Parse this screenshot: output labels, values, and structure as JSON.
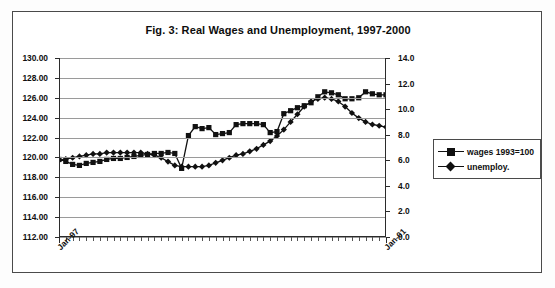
{
  "chart_data": {
    "type": "line",
    "title": "Fig. 3: Real Wages and Unemployment, 1997-2000",
    "xlabel": "",
    "ylabel": "",
    "grid": true,
    "legend_position": "right",
    "x_tick_labels": [
      "Jan-97",
      "Jan-01"
    ],
    "x_tick_label_positions": [
      0,
      48
    ],
    "x_count": 49,
    "y_left": {
      "min": 112.0,
      "max": 130.0,
      "step": 2.0,
      "ticks": [
        "112.00",
        "114.00",
        "116.00",
        "118.00",
        "120.00",
        "122.00",
        "124.00",
        "126.00",
        "128.00",
        "130.00"
      ]
    },
    "y_right": {
      "min": 0.0,
      "max": 14.0,
      "step": 2.0,
      "ticks": [
        "0.0",
        "2.0",
        "4.0",
        "6.0",
        "8.0",
        "10.0",
        "12.0",
        "14.0"
      ]
    },
    "series": [
      {
        "name": "wages 1993=100",
        "marker": "square",
        "axis": "left",
        "color": "#111111",
        "values": [
          119.8,
          119.6,
          119.3,
          119.2,
          119.4,
          119.5,
          119.6,
          119.8,
          119.9,
          119.9,
          120.0,
          120.1,
          120.2,
          120.3,
          120.4,
          120.4,
          120.5,
          120.4,
          118.9,
          122.2,
          123.1,
          122.9,
          123.0,
          122.3,
          122.4,
          122.5,
          123.3,
          123.4,
          123.4,
          123.4,
          123.3,
          122.5,
          122.6,
          124.4,
          124.7,
          125.0,
          125.2,
          125.5,
          126.1,
          126.6,
          126.5,
          126.3,
          125.9,
          125.9,
          126.0,
          126.6,
          126.4,
          126.3,
          126.3
        ]
      },
      {
        "name": "unemploy.",
        "marker": "diamond",
        "axis": "right",
        "color": "#111111",
        "values": [
          6.0,
          6.1,
          6.2,
          6.3,
          6.4,
          6.5,
          6.5,
          6.6,
          6.6,
          6.6,
          6.6,
          6.6,
          6.6,
          6.5,
          6.4,
          6.2,
          5.9,
          5.6,
          5.5,
          5.5,
          5.5,
          5.5,
          5.6,
          5.8,
          6.0,
          6.2,
          6.4,
          6.5,
          6.7,
          6.9,
          7.2,
          7.5,
          7.9,
          8.4,
          9.0,
          9.6,
          10.2,
          10.6,
          10.8,
          10.9,
          10.8,
          10.6,
          10.2,
          9.7,
          9.3,
          9.0,
          8.8,
          8.7,
          8.6
        ]
      }
    ]
  },
  "legend": {
    "items": [
      {
        "label": "wages 1993=100"
      },
      {
        "label": "unemploy."
      }
    ]
  }
}
